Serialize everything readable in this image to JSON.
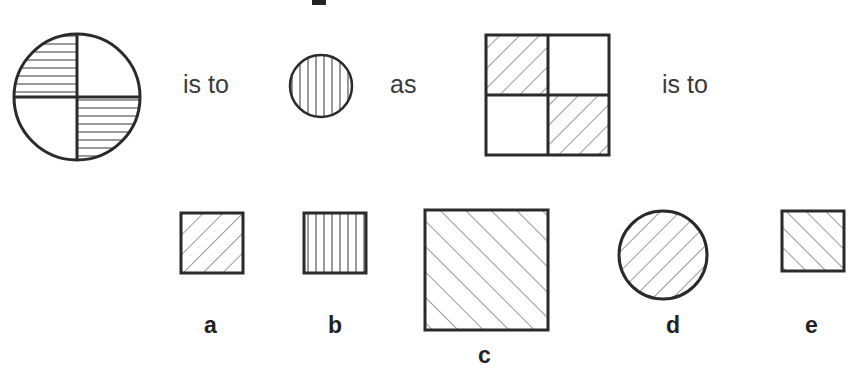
{
  "puzzle": {
    "type": "figural analogy",
    "words": {
      "first_is_to": "is to",
      "as": "as",
      "second_is_to": "is to"
    },
    "figures": {
      "premise_a": {
        "shape": "circle divided in quarters",
        "shading": "horizontal lines in top-left and bottom-right quarters"
      },
      "premise_b": {
        "shape": "small circle",
        "shading": "vertical lines"
      },
      "premise_c": {
        "shape": "square divided in quarters",
        "shading": "diagonal lines (/) in top-left and bottom-right quarters"
      }
    },
    "options": [
      {
        "label": "a",
        "shape": "small square",
        "shading": "diagonal lines /"
      },
      {
        "label": "b",
        "shape": "small square",
        "shading": "vertical lines"
      },
      {
        "label": "c",
        "shape": "large square",
        "shading": "diagonal lines \\"
      },
      {
        "label": "d",
        "shape": "circle",
        "shading": "diagonal lines /"
      },
      {
        "label": "e",
        "shape": "small square",
        "shading": "diagonal lines \\"
      }
    ]
  },
  "colors": {
    "stroke": "#2a2a2a",
    "hatch": "#555555",
    "background": "#ffffff"
  }
}
